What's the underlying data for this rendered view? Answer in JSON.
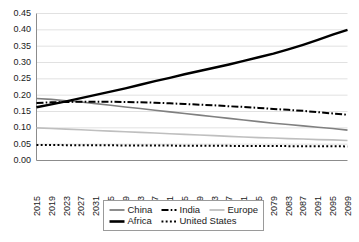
{
  "chart_data": {
    "type": "line",
    "title": "",
    "xlabel": "",
    "ylabel": "",
    "ylim": [
      0.0,
      0.45
    ],
    "xlim": [
      2015,
      2099
    ],
    "grid": true,
    "legend_position": "bottom",
    "ytick_labels": [
      "0.00",
      "0.05",
      "0.10",
      "0.15",
      "0.20",
      "0.25",
      "0.30",
      "0.35",
      "0.40",
      "0.45"
    ],
    "ytick_values": [
      0.0,
      0.05,
      0.1,
      0.15,
      0.2,
      0.25,
      0.3,
      0.35,
      0.4,
      0.45
    ],
    "xtick_labels": [
      "2015",
      "2019",
      "2023",
      "2027",
      "2031",
      "2035",
      "2039",
      "2043",
      "2047",
      "2051",
      "2055",
      "2059",
      "2063",
      "2067",
      "2071",
      "2075",
      "2079",
      "2083",
      "2087",
      "2091",
      "2095",
      "2099"
    ],
    "xtick_values": [
      2015,
      2019,
      2023,
      2027,
      2031,
      2035,
      2039,
      2043,
      2047,
      2051,
      2055,
      2059,
      2063,
      2067,
      2071,
      2075,
      2079,
      2083,
      2087,
      2091,
      2095,
      2099
    ],
    "x": [
      2015,
      2019,
      2023,
      2027,
      2031,
      2035,
      2039,
      2043,
      2047,
      2051,
      2055,
      2059,
      2063,
      2067,
      2071,
      2075,
      2079,
      2083,
      2087,
      2091,
      2095,
      2099
    ],
    "series": [
      {
        "name": "China",
        "color": "#808080",
        "style": "solid",
        "width": 1.6,
        "values": [
          0.19,
          0.187,
          0.183,
          0.179,
          0.174,
          0.169,
          0.164,
          0.159,
          0.154,
          0.149,
          0.144,
          0.139,
          0.134,
          0.129,
          0.124,
          0.119,
          0.114,
          0.11,
          0.106,
          0.102,
          0.098,
          0.093
        ]
      },
      {
        "name": "India",
        "color": "#000000",
        "style": "dash-dot",
        "width": 2.0,
        "values": [
          0.176,
          0.178,
          0.179,
          0.18,
          0.18,
          0.18,
          0.179,
          0.178,
          0.177,
          0.175,
          0.173,
          0.171,
          0.169,
          0.166,
          0.164,
          0.161,
          0.158,
          0.155,
          0.152,
          0.148,
          0.144,
          0.14
        ]
      },
      {
        "name": "Europe",
        "color": "#bfbfbf",
        "style": "solid",
        "width": 1.6,
        "values": [
          0.1,
          0.098,
          0.096,
          0.094,
          0.092,
          0.09,
          0.088,
          0.086,
          0.084,
          0.082,
          0.08,
          0.078,
          0.076,
          0.074,
          0.072,
          0.07,
          0.069,
          0.067,
          0.066,
          0.064,
          0.063,
          0.061
        ]
      },
      {
        "name": "Africa",
        "color": "#000000",
        "style": "solid",
        "width": 2.4,
        "values": [
          0.163,
          0.172,
          0.181,
          0.191,
          0.201,
          0.211,
          0.221,
          0.232,
          0.243,
          0.253,
          0.264,
          0.274,
          0.284,
          0.294,
          0.305,
          0.316,
          0.327,
          0.34,
          0.354,
          0.369,
          0.385,
          0.4
        ]
      },
      {
        "name": "United States",
        "color": "#000000",
        "style": "dotted",
        "width": 2.0,
        "values": [
          0.0475,
          0.0473,
          0.047,
          0.0468,
          0.0466,
          0.0464,
          0.0462,
          0.046,
          0.0458,
          0.0456,
          0.0454,
          0.0452,
          0.045,
          0.0448,
          0.0446,
          0.0444,
          0.0442,
          0.044,
          0.0438,
          0.0436,
          0.0434,
          0.0432
        ]
      }
    ],
    "legend": [
      {
        "label": "China",
        "color": "#808080",
        "style": "solid",
        "width": 1.8
      },
      {
        "label": "India",
        "color": "#000000",
        "style": "dash-dot",
        "width": 2.0
      },
      {
        "label": "Europe",
        "color": "#bfbfbf",
        "style": "solid",
        "width": 1.8
      },
      {
        "label": "Africa",
        "color": "#000000",
        "style": "solid",
        "width": 2.6
      },
      {
        "label": "United States",
        "color": "#000000",
        "style": "dotted",
        "width": 2.0
      }
    ]
  }
}
